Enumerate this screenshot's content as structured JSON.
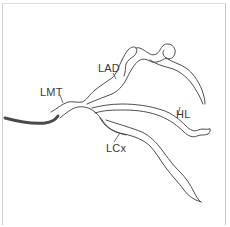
{
  "diagram": {
    "labels": [
      {
        "id": "lmt",
        "text": "LMT",
        "x": 40,
        "y": 87
      },
      {
        "id": "lad",
        "text": "LAD",
        "x": 98,
        "y": 63
      },
      {
        "id": "hl",
        "text": "HL",
        "x": 176,
        "y": 109
      },
      {
        "id": "lcx",
        "text": "LCx",
        "x": 106,
        "y": 143
      }
    ],
    "colors": {
      "line": "#3a3a3a",
      "catheter": "#4a4a4a",
      "frame": "#cfcfcf",
      "background": "#ffffff"
    }
  }
}
